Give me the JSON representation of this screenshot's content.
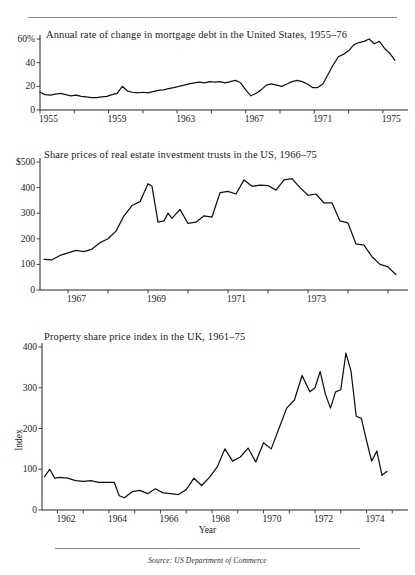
{
  "figure": {
    "source_note": "Source: US Department of Commerce",
    "has_top_rule": true,
    "has_bottom_rule": true
  },
  "chart_data": [
    {
      "type": "line",
      "title": "Annual rate of change in mortgage debt in the United States, 1955–76",
      "xlabel": "",
      "ylabel": "",
      "ylim": [
        0,
        60
      ],
      "yticks": [
        0,
        20,
        40,
        60
      ],
      "ytick_labels": [
        "0",
        "20",
        "40",
        "60%"
      ],
      "xlim": [
        1955,
        1976
      ],
      "xticks": [
        1955,
        1957,
        1959,
        1961,
        1963,
        1965,
        1967,
        1969,
        1971,
        1973,
        1975
      ],
      "xtick_labels": [
        "1955",
        "",
        "1959",
        "",
        "1963",
        "",
        "1967",
        "",
        "1971",
        "",
        "1975"
      ],
      "grid": false,
      "legend": "none",
      "x": [
        1955.0,
        1955.3,
        1955.6,
        1955.9,
        1956.2,
        1956.5,
        1956.8,
        1957.1,
        1957.4,
        1957.7,
        1958.0,
        1958.3,
        1958.6,
        1958.9,
        1959.2,
        1959.5,
        1959.8,
        1960.1,
        1960.4,
        1960.7,
        1961.0,
        1961.3,
        1961.6,
        1961.9,
        1962.2,
        1962.5,
        1962.8,
        1963.1,
        1963.4,
        1963.7,
        1964.0,
        1964.3,
        1964.6,
        1964.9,
        1965.2,
        1965.5,
        1965.8,
        1966.1,
        1966.4,
        1966.7,
        1967.0,
        1967.3,
        1967.6,
        1967.9,
        1968.2,
        1968.5,
        1968.8,
        1969.1,
        1969.4,
        1969.7,
        1970.0,
        1970.3,
        1970.6,
        1970.9,
        1971.2,
        1971.5,
        1971.8,
        1972.1,
        1972.4,
        1972.7,
        1973.0,
        1973.3,
        1973.6,
        1973.9,
        1974.2,
        1974.5,
        1974.8,
        1975.1,
        1975.4,
        1975.7
      ],
      "values": [
        15,
        13,
        12.5,
        13.5,
        14,
        13,
        12,
        12.5,
        11.5,
        11,
        10.5,
        10.5,
        11,
        11.5,
        13,
        14,
        20,
        16,
        15,
        14.5,
        15,
        14.5,
        15.5,
        16.5,
        17,
        18,
        19,
        20,
        21,
        22,
        23,
        23.5,
        23,
        24,
        23.5,
        24,
        23,
        24,
        25,
        23,
        17,
        12,
        14,
        17,
        21,
        22,
        21,
        20,
        22,
        24,
        25,
        24,
        22,
        19,
        19,
        22,
        30,
        38,
        45,
        47,
        50,
        55,
        57,
        58,
        60,
        56,
        58,
        52,
        48,
        42
      ],
      "line_values_note": "percent annual rate of change"
    },
    {
      "type": "line",
      "title": "Share prices of real estate investment trusts in the US, 1966–75",
      "xlabel": "",
      "ylabel": "",
      "ylim": [
        0,
        500
      ],
      "yticks": [
        0,
        100,
        200,
        300,
        400,
        500
      ],
      "ytick_labels": [
        "0",
        "100",
        "200",
        "300",
        "400",
        "$500"
      ],
      "xlim": [
        1966.3,
        1975.3
      ],
      "xticks": [
        1967,
        1968,
        1969,
        1970,
        1971,
        1972,
        1973,
        1974,
        1975
      ],
      "xtick_labels": [
        "1967",
        "",
        "1969",
        "",
        "1971",
        "",
        "1973",
        "",
        ""
      ],
      "grid": false,
      "legend": "none",
      "x": [
        1966.4,
        1966.6,
        1966.8,
        1967.0,
        1967.2,
        1967.4,
        1967.6,
        1967.8,
        1968.0,
        1968.2,
        1968.4,
        1968.6,
        1968.8,
        1969.0,
        1969.1,
        1969.25,
        1969.4,
        1969.5,
        1969.6,
        1969.8,
        1970.0,
        1970.2,
        1970.4,
        1970.6,
        1970.8,
        1971.0,
        1971.2,
        1971.4,
        1971.6,
        1971.8,
        1972.0,
        1972.2,
        1972.4,
        1972.6,
        1972.8,
        1973.0,
        1973.2,
        1973.4,
        1973.6,
        1973.8,
        1974.0,
        1974.2,
        1974.4,
        1974.6,
        1974.8,
        1975.0,
        1975.2
      ],
      "values": [
        120,
        118,
        135,
        145,
        155,
        150,
        160,
        185,
        200,
        230,
        290,
        330,
        345,
        415,
        405,
        265,
        270,
        300,
        280,
        315,
        260,
        265,
        290,
        285,
        380,
        385,
        375,
        430,
        405,
        410,
        408,
        390,
        430,
        435,
        400,
        370,
        375,
        340,
        340,
        270,
        262,
        180,
        175,
        130,
        100,
        90,
        60
      ],
      "line_values_note": "share price index in US dollars"
    },
    {
      "type": "line",
      "title": "Property share price index in the UK, 1961–75",
      "xlabel": "Year",
      "ylabel": "Index",
      "ylim": [
        0,
        400
      ],
      "yticks": [
        0,
        100,
        200,
        300,
        400
      ],
      "ytick_labels": [
        "0",
        "100",
        "200",
        "300",
        "400"
      ],
      "xlim": [
        1961.4,
        1975.3
      ],
      "xticks": [
        1962,
        1963,
        1964,
        1965,
        1966,
        1967,
        1968,
        1969,
        1970,
        1971,
        1972,
        1973,
        1974,
        1975
      ],
      "xtick_labels": [
        "1962",
        "",
        "1964",
        "",
        "1966",
        "",
        "1968",
        "",
        "1970",
        "",
        "1972",
        "",
        "1974",
        ""
      ],
      "grid": false,
      "legend": "none",
      "x": [
        1961.5,
        1961.7,
        1961.9,
        1962.1,
        1962.4,
        1962.7,
        1963.0,
        1963.3,
        1963.6,
        1963.9,
        1964.2,
        1964.4,
        1964.6,
        1964.9,
        1965.2,
        1965.5,
        1965.8,
        1966.1,
        1966.4,
        1966.7,
        1967.0,
        1967.3,
        1967.6,
        1967.9,
        1968.2,
        1968.5,
        1968.8,
        1969.1,
        1969.4,
        1969.7,
        1970.0,
        1970.3,
        1970.6,
        1970.9,
        1971.2,
        1971.5,
        1971.8,
        1972.0,
        1972.2,
        1972.4,
        1972.6,
        1972.8,
        1973.0,
        1973.2,
        1973.4,
        1973.6,
        1973.8,
        1974.0,
        1974.2,
        1974.4,
        1974.6,
        1974.8
      ],
      "values": [
        82,
        100,
        78,
        80,
        78,
        72,
        70,
        72,
        68,
        68,
        68,
        35,
        30,
        45,
        48,
        40,
        52,
        42,
        40,
        38,
        50,
        78,
        60,
        80,
        105,
        150,
        120,
        130,
        152,
        118,
        165,
        150,
        200,
        250,
        270,
        330,
        290,
        300,
        340,
        285,
        250,
        290,
        295,
        385,
        340,
        230,
        225,
        170,
        120,
        145,
        85,
        95
      ],
      "line_values_note": "UK property share price index"
    }
  ]
}
